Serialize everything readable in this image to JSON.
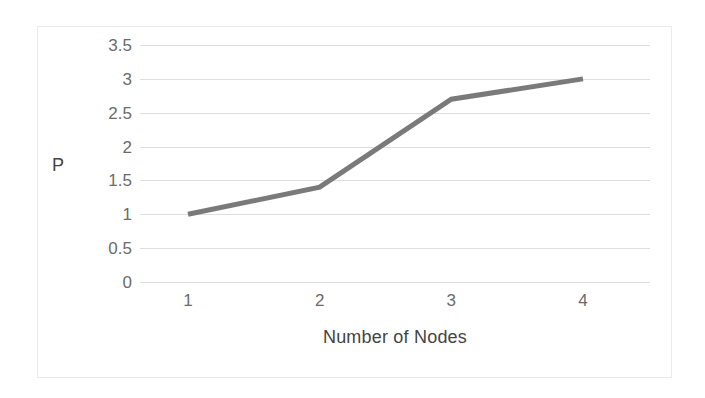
{
  "chart_data": {
    "type": "line",
    "title": "",
    "subtitle": "",
    "xlabel": "Number of Nodes",
    "ylabel": "P",
    "categories": [
      "1",
      "2",
      "3",
      "4"
    ],
    "x": [
      1,
      2,
      3,
      4
    ],
    "values": [
      1,
      1.4,
      2.7,
      3
    ],
    "series": [
      {
        "name": "P",
        "values": [
          1,
          1.4,
          2.7,
          3
        ],
        "color": "#7a7a7a",
        "line_width": 5,
        "markers": false
      }
    ],
    "ylim": [
      0,
      3.5
    ],
    "ytick_labels": [
      "3.5",
      "3",
      "2.5",
      "2",
      "1.5",
      "1",
      "0.5",
      "0"
    ],
    "ytick_values": [
      3.5,
      3,
      2.5,
      2,
      1.5,
      1,
      0.5,
      0
    ],
    "xtick_labels": [
      "1",
      "2",
      "3",
      "4"
    ],
    "grid": "horizontal",
    "grid_color": "#dedede",
    "legend": "none",
    "legend_position": "",
    "background_color": "#ffffff",
    "frame_color": "#ebebeb",
    "tick_label_color": "#6b6b6b",
    "axis_title_color": "#444444",
    "annotations": []
  }
}
